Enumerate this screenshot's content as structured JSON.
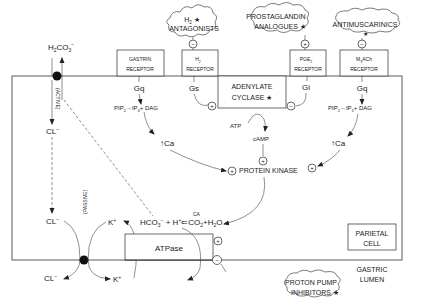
{
  "drugs": {
    "h2_antagonists": {
      "line1": "H",
      "sub": "2",
      "line1_suffix": " ★",
      "line2": "ANTAGONISTS",
      "effect": "−"
    },
    "prostaglandin": {
      "line1": "PROSTAGLANDIN",
      "line2": "ANALOGUES ★",
      "effect": "+"
    },
    "antimuscarinics": {
      "line1": "ANTIMUSCARINICS",
      "line2": "★",
      "effect": "−"
    },
    "ppi": {
      "line1": "PROTON PUMP",
      "line2": "INHIBITORS ★",
      "effect": "−"
    }
  },
  "receptors": {
    "gastrin": {
      "line1": "GASTRIN",
      "line2": "RECEPTOR",
      "g_protein": "Gq"
    },
    "h2": {
      "line1": "H",
      "sub": "2",
      "line2": "RECEPTOR",
      "g_protein": "Gs"
    },
    "pge2": {
      "line1": "PGE",
      "sub": "2",
      "line2": "RECEPTOR",
      "g_protein": "Gi"
    },
    "m3": {
      "line1": "M",
      "sub": "3",
      "line1_suffix": "ACh",
      "line2": "RECEPTOR",
      "g_protein": "Gq"
    }
  },
  "adenylate_cyclase": {
    "line1": "ADENYLATE",
    "line2": "CYCLASE ★"
  },
  "pathway": {
    "pip2_left": "PIP",
    "pip2_sub": "2",
    "arrow": "→",
    "ip3": "IP",
    "ip3_sub": "3",
    "dag": "+ DAG",
    "ca_left": "↑Ca",
    "ca_right": "↑Ca",
    "atp": "ATP",
    "camp": "cAMP",
    "protein_kinase": "PROTEIN KINASE",
    "plus": "+",
    "minus": "−"
  },
  "transport": {
    "h2co3": "H",
    "h2co3_sub": "2",
    "h2co3_mid": "CO",
    "h2co3_sub2": "3",
    "h2co3_sup": "−",
    "active_label": "(ACTIVE)",
    "passive_label": "(PASSIVE)",
    "cl_in_top": "CL",
    "cl_in_bottom": "CL",
    "cl_out": "CL",
    "cl_sup": "−",
    "k_in": "K",
    "k_out": "K",
    "k_sup": "+",
    "hco3": "HCO",
    "hco3_sub": "3",
    "hco3_sup": "−",
    "h_plus": " + H",
    "h_sup": "+",
    "ca_enzyme": "CA",
    "reverse_arrow": "⇐",
    "co2": "CO",
    "co2_sub": "2",
    "water": "+H",
    "water_sub": "2",
    "water_o": "O",
    "atpase": "ATPase"
  },
  "labels": {
    "parietal_cell": {
      "line1": "PARIETAL",
      "line2": "CELL"
    },
    "gastric_lumen": {
      "line1": "GASTRIC",
      "line2": "LUMEN"
    }
  }
}
